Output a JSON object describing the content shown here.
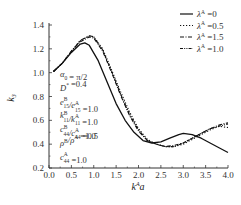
{
  "chart_data": {
    "type": "line",
    "title": "",
    "xlabel": "k^A a",
    "ylabel": "k_3",
    "xlim": [
      0.0,
      4.0
    ],
    "ylim": [
      0.2,
      1.4
    ],
    "xticks": [
      "0.0",
      "0.5",
      "1.0",
      "1.5",
      "2.0",
      "2.5",
      "3.0",
      "3.5",
      "4.0"
    ],
    "yticks": [
      "0.2",
      "0.4",
      "0.6",
      "0.8",
      "1.0",
      "1.2",
      "1.4"
    ],
    "grid": false,
    "legend_position": "top-right",
    "annotations": [
      "α0 = π/2",
      "D* = 0.4",
      "e15B/e15A = 1.0",
      "k11B/k11A = 1.0",
      "c44B/c44A = 0.5",
      "ρB/ρA = 1.0",
      "c44A = 1.0"
    ],
    "series": [
      {
        "name": "λA=0",
        "style": "solid",
        "x": [
          0.1,
          0.3,
          0.5,
          0.7,
          0.8,
          0.9,
          1.1,
          1.3,
          1.5,
          1.7,
          1.9,
          2.1,
          2.3,
          2.5,
          2.7,
          2.9,
          3.0,
          3.2,
          3.4,
          3.6,
          3.8,
          4.0
        ],
        "y": [
          1.01,
          1.08,
          1.17,
          1.24,
          1.25,
          1.23,
          1.1,
          0.92,
          0.74,
          0.6,
          0.5,
          0.43,
          0.41,
          0.42,
          0.45,
          0.48,
          0.49,
          0.48,
          0.45,
          0.41,
          0.37,
          0.33
        ]
      },
      {
        "name": "λA=0.5",
        "style": "dotted",
        "x": [
          0.1,
          0.3,
          0.5,
          0.7,
          0.9,
          1.0,
          1.2,
          1.4,
          1.6,
          1.8,
          2.0,
          2.2,
          2.4,
          2.6,
          2.8,
          3.0,
          3.2,
          3.4,
          3.6,
          3.8,
          4.0
        ],
        "y": [
          1.01,
          1.08,
          1.18,
          1.27,
          1.31,
          1.3,
          1.2,
          1.02,
          0.84,
          0.67,
          0.53,
          0.44,
          0.4,
          0.38,
          0.38,
          0.4,
          0.44,
          0.48,
          0.52,
          0.55,
          0.54
        ]
      },
      {
        "name": "λA=1.5",
        "style": "dash-dot",
        "x": [
          0.1,
          0.3,
          0.5,
          0.7,
          0.9,
          1.0,
          1.2,
          1.4,
          1.6,
          1.8,
          2.0,
          2.2,
          2.4,
          2.6,
          2.8,
          3.0,
          3.2,
          3.4,
          3.6,
          3.8,
          4.0
        ],
        "y": [
          1.01,
          1.08,
          1.18,
          1.26,
          1.3,
          1.29,
          1.18,
          1.0,
          0.81,
          0.64,
          0.51,
          0.43,
          0.4,
          0.38,
          0.39,
          0.41,
          0.45,
          0.49,
          0.53,
          0.56,
          0.58
        ]
      },
      {
        "name": "λA=1.0",
        "style": "dash-dot-dot",
        "x": [
          0.1,
          0.3,
          0.5,
          0.7,
          0.9,
          1.0,
          1.2,
          1.4,
          1.6,
          1.8,
          2.0,
          2.2,
          2.4,
          2.6,
          2.8,
          3.0,
          3.2,
          3.4,
          3.6,
          3.8,
          4.0
        ],
        "y": [
          1.01,
          1.08,
          1.18,
          1.27,
          1.31,
          1.3,
          1.19,
          1.01,
          0.82,
          0.65,
          0.52,
          0.43,
          0.4,
          0.38,
          0.38,
          0.41,
          0.45,
          0.49,
          0.53,
          0.55,
          0.57
        ]
      }
    ]
  },
  "legend": [
    {
      "label": "λA=0",
      "style": "solid"
    },
    {
      "label": "λA=0.5",
      "style": "dotted"
    },
    {
      "label": "λA=1.5",
      "style": "dash-dot"
    },
    {
      "label": "λA=1.0",
      "style": "dash-dot-dot"
    }
  ],
  "axes": {
    "xlabel_main": "k",
    "xlabel_sup": "A",
    "xlabel_tail": "a",
    "ylabel_main": "k",
    "ylabel_sub": "3"
  },
  "annotations": [
    {
      "main": "α",
      "sub": "0",
      "sup": "",
      "rest": " = π/2"
    },
    {
      "main": "D",
      "sub": "",
      "sup": "*",
      "rest": " =0.4"
    },
    {
      "main": "e",
      "sub": "15",
      "sup": "B",
      "rest2main": "/e",
      "sub2": "15",
      "sup2": "A",
      "rest": " =1.0"
    },
    {
      "main": "k",
      "sub": "11",
      "sup": "B",
      "rest2main": "/k",
      "sub2": "11",
      "sup2": "A",
      "rest": " =1.0"
    },
    {
      "main": "c",
      "sub": "44",
      "sup": "B",
      "rest2main": "/c",
      "sub2": "44",
      "sup2": "A",
      "rest": " =0.5"
    },
    {
      "main": "ρ",
      "sub": "",
      "sup": "B",
      "rest2main": "/ρ",
      "sub2": "",
      "sup2": "A",
      "rest": " =1.0"
    },
    {
      "main": "c",
      "sub": "44",
      "sup": "A",
      "rest": " =1.0"
    }
  ]
}
